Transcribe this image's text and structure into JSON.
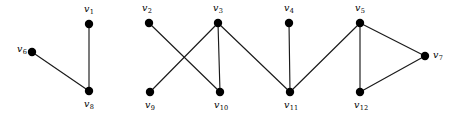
{
  "figure": {
    "type": "undirected-graph-diagram",
    "background_color": "#ffffff",
    "edge_color": "#1a1a1a",
    "vertex_color": "#000000",
    "label_color": "#000000",
    "vertex_radius": 4.2,
    "edge_width": 1.15,
    "width": 457,
    "height": 120
  },
  "vertices": [
    {
      "id": "v1",
      "label": "v",
      "sub": "1",
      "x": 89,
      "y": 24,
      "label_x": 89,
      "label_y": 12,
      "anchor": "middle"
    },
    {
      "id": "v2",
      "label": "v",
      "sub": "2",
      "x": 149,
      "y": 23,
      "label_x": 147,
      "label_y": 11,
      "anchor": "middle"
    },
    {
      "id": "v3",
      "label": "v",
      "sub": "3",
      "x": 218,
      "y": 23,
      "label_x": 218,
      "label_y": 11,
      "anchor": "middle"
    },
    {
      "id": "v4",
      "label": "v",
      "sub": "4",
      "x": 289,
      "y": 23,
      "label_x": 289,
      "label_y": 11,
      "anchor": "middle"
    },
    {
      "id": "v5",
      "label": "v",
      "sub": "5",
      "x": 360,
      "y": 23,
      "label_x": 360,
      "label_y": 11,
      "anchor": "middle"
    },
    {
      "id": "v6",
      "label": "v",
      "sub": "6",
      "x": 32,
      "y": 52,
      "label_x": 22,
      "label_y": 52,
      "anchor": "middle"
    },
    {
      "id": "v7",
      "label": "v",
      "sub": "7",
      "x": 425,
      "y": 56,
      "label_x": 438,
      "label_y": 58,
      "anchor": "middle"
    },
    {
      "id": "v8",
      "label": "v",
      "sub": "8",
      "x": 89,
      "y": 91,
      "label_x": 89,
      "label_y": 107,
      "anchor": "middle"
    },
    {
      "id": "v9",
      "label": "v",
      "sub": "9",
      "x": 150,
      "y": 92,
      "label_x": 150,
      "label_y": 108,
      "anchor": "middle"
    },
    {
      "id": "v10",
      "label": "v",
      "sub": "10",
      "x": 220,
      "y": 92,
      "label_x": 221,
      "label_y": 108,
      "anchor": "middle"
    },
    {
      "id": "v11",
      "label": "v",
      "sub": "11",
      "x": 290,
      "y": 92,
      "label_x": 291,
      "label_y": 108,
      "anchor": "middle"
    },
    {
      "id": "v12",
      "label": "v",
      "sub": "12",
      "x": 360,
      "y": 92,
      "label_x": 361,
      "label_y": 108,
      "anchor": "middle"
    }
  ],
  "edges": [
    {
      "id": "e-v1-v8",
      "from": "v1",
      "to": "v8"
    },
    {
      "id": "e-v6-v8",
      "from": "v6",
      "to": "v8"
    },
    {
      "id": "e-v2-v10",
      "from": "v2",
      "to": "v10"
    },
    {
      "id": "e-v3-v9",
      "from": "v3",
      "to": "v9"
    },
    {
      "id": "e-v3-v10",
      "from": "v3",
      "to": "v10"
    },
    {
      "id": "e-v3-v11",
      "from": "v3",
      "to": "v11"
    },
    {
      "id": "e-v4-v11",
      "from": "v4",
      "to": "v11"
    },
    {
      "id": "e-v5-v11",
      "from": "v5",
      "to": "v11"
    },
    {
      "id": "e-v5-v12",
      "from": "v5",
      "to": "v12"
    },
    {
      "id": "e-v5-v7",
      "from": "v5",
      "to": "v7"
    },
    {
      "id": "e-v12-v7",
      "from": "v12",
      "to": "v7"
    }
  ],
  "components": [
    {
      "name": "component-1",
      "vertices": [
        "v1",
        "v6",
        "v8"
      ]
    },
    {
      "name": "component-2",
      "vertices": [
        "v2",
        "v3",
        "v4",
        "v5",
        "v7",
        "v9",
        "v10",
        "v11",
        "v12"
      ]
    }
  ]
}
